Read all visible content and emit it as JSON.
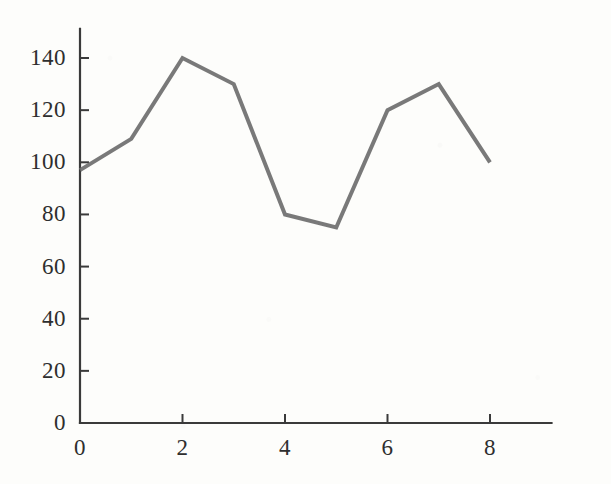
{
  "chart_data": {
    "type": "line",
    "title": "",
    "subtitle": "",
    "xlabel": "",
    "ylabel": "",
    "x": [
      0,
      1,
      2,
      3,
      4,
      5,
      6,
      7,
      8
    ],
    "values": [
      97,
      109,
      140,
      130,
      80,
      75,
      120,
      130,
      100
    ],
    "series": [
      {
        "name": "series-1",
        "values": [
          97,
          109,
          140,
          130,
          80,
          75,
          120,
          130,
          100
        ],
        "color": "#6e6e6e",
        "line_width": 4
      }
    ],
    "xlim": [
      0,
      9.2
    ],
    "ylim": [
      0,
      150
    ],
    "x_ticks": [
      0,
      2,
      4,
      6,
      8
    ],
    "x_tick_labels": [
      "0",
      "2",
      "4",
      "6",
      "8"
    ],
    "y_ticks": [
      0,
      20,
      40,
      60,
      80,
      100,
      120,
      140
    ],
    "y_tick_labels": [
      "0",
      "20",
      "40",
      "60",
      "80",
      "100",
      "120",
      "140"
    ],
    "grid": false,
    "legend": null,
    "legend_position": "none",
    "annotations": [],
    "axis_color": "#3a3a3a",
    "background_color": "#fdfdfb"
  },
  "axes": {
    "y_axis_name": "y-axis",
    "x_axis_name": "x-axis"
  }
}
